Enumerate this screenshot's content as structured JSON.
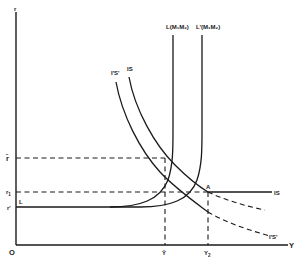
{
  "diagram": {
    "type": "IS-LM diagram",
    "axes": {
      "y_axis_label": "r",
      "x_axis_label": "Y",
      "origin_label": "O"
    },
    "y_ticks": {
      "r_bar": "r̄",
      "r1": "r",
      "r1_sub": "1",
      "r_prime": "r'",
      "L_start": "L"
    },
    "x_ticks": {
      "y_bar": "Ȳ",
      "y2": "Y",
      "y2_sub": "2"
    },
    "curves": {
      "L": "L(M₁M₂)",
      "L_prime": "L'(M₁M₂)",
      "IS": "IS",
      "IS_prime": "I'S'",
      "IS_right": "IS",
      "IS_prime_right": "I'S'"
    },
    "points": {
      "A": "A"
    },
    "colors": {
      "ink": "#1a1a1a",
      "background": "#ffffff"
    }
  }
}
